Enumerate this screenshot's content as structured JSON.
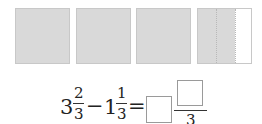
{
  "figure": {
    "squares": [
      {
        "shaded_fraction": "1"
      },
      {
        "shaded_fraction": "1"
      },
      {
        "shaded_fraction": "1"
      },
      {
        "shaded_fraction": "2/3"
      }
    ],
    "colors": {
      "shaded": "#d9d9d9",
      "unshaded": "#ffffff",
      "border": "#c8c8c8"
    }
  },
  "equation": {
    "term1_whole": "3",
    "term1_num": "2",
    "term1_den": "3",
    "operator": "−",
    "term2_whole": "1",
    "term2_num": "1",
    "term2_den": "3",
    "equals": "=",
    "answer_den": "3"
  }
}
